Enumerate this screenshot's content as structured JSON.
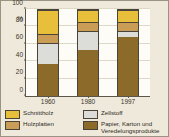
{
  "chart_data": {
    "type": "bar",
    "subtype": "stacked-100-percent",
    "title": "",
    "xlabel": "",
    "ylabel": "%",
    "categories": [
      "1960",
      "1980",
      "1997"
    ],
    "ylim": [
      0,
      100
    ],
    "yticks": [
      0,
      20,
      40,
      60,
      80,
      100
    ],
    "grid": true,
    "legend_position": "bottom",
    "series": [
      {
        "name": "Papier, Karton und\nVeredelungsprodukte",
        "key": "papier",
        "color": "#8b6a2a",
        "values": [
          37,
          53,
          69
        ]
      },
      {
        "name": "Zellstoff",
        "key": "zellstoff",
        "color": "#dcdcd8",
        "values": [
          25,
          23,
          7
        ]
      },
      {
        "name": "Holzplatten",
        "key": "holzplatten",
        "color": "#c99d55",
        "values": [
          10,
          10,
          10
        ]
      },
      {
        "name": "Schnittholz",
        "key": "schnittholz",
        "color": "#e8bf3a",
        "values": [
          28,
          14,
          14
        ]
      }
    ]
  },
  "axes": {
    "y_unit": "%",
    "yticks": [
      "100",
      "80",
      "60",
      "40",
      "20",
      "0"
    ],
    "xticks": [
      "1960",
      "1980",
      "1997"
    ]
  },
  "legend": {
    "items": [
      {
        "label": "Schnittholz",
        "color": "#e8bf3a"
      },
      {
        "label": "Zellstoff",
        "color": "#dcdcd8"
      },
      {
        "label": "Holzplatten",
        "color": "#c99d55"
      },
      {
        "label": "Papier, Karton und Veredelungsprodukte",
        "color": "#8b6a2a"
      }
    ]
  },
  "source": {
    "text": ""
  }
}
